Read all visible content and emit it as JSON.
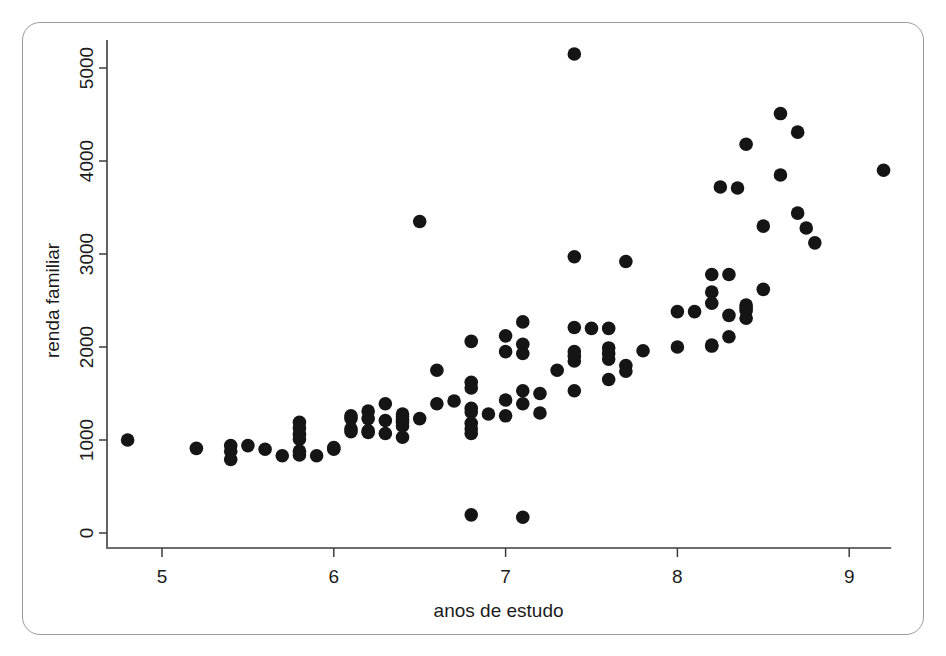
{
  "figure": {
    "frame_visible": true,
    "background_color": "#ffffff",
    "point_color": "#151515",
    "axis_color": "#3c3c3c"
  },
  "chart_data": {
    "type": "scatter",
    "title": "",
    "xlabel": "anos de estudo",
    "ylabel": "renda familiar",
    "xlim": [
      4.6,
      9.4
    ],
    "ylim": [
      -200,
      5400
    ],
    "xticks": [
      5,
      6,
      7,
      8,
      9
    ],
    "xtick_labels": [
      "5",
      "6",
      "7",
      "8",
      "9"
    ],
    "yticks": [
      0,
      1000,
      2000,
      3000,
      4000,
      5000
    ],
    "ytick_labels": [
      "0",
      "1000",
      "2000",
      "3000",
      "4000",
      "5000"
    ],
    "grid": false,
    "legend": false,
    "marker": "filled-circle",
    "marker_size": 9,
    "n_points": 108,
    "points": [
      [
        4.8,
        1000
      ],
      [
        5.2,
        910
      ],
      [
        5.4,
        940
      ],
      [
        5.4,
        880
      ],
      [
        5.4,
        790
      ],
      [
        5.5,
        940
      ],
      [
        5.6,
        900
      ],
      [
        5.7,
        830
      ],
      [
        5.8,
        1190
      ],
      [
        5.8,
        1130
      ],
      [
        5.8,
        1060
      ],
      [
        5.8,
        1010
      ],
      [
        5.8,
        880
      ],
      [
        5.8,
        840
      ],
      [
        5.9,
        830
      ],
      [
        6.0,
        900
      ],
      [
        6.0,
        920
      ],
      [
        6.1,
        1260
      ],
      [
        6.1,
        1230
      ],
      [
        6.1,
        1120
      ],
      [
        6.1,
        1090
      ],
      [
        6.2,
        1310
      ],
      [
        6.2,
        1230
      ],
      [
        6.2,
        1100
      ],
      [
        6.2,
        1080
      ],
      [
        6.3,
        1390
      ],
      [
        6.3,
        1210
      ],
      [
        6.3,
        1070
      ],
      [
        6.4,
        1280
      ],
      [
        6.4,
        1250
      ],
      [
        6.4,
        1220
      ],
      [
        6.4,
        1190
      ],
      [
        6.4,
        1150
      ],
      [
        6.4,
        1030
      ],
      [
        6.5,
        1230
      ],
      [
        6.5,
        3350
      ],
      [
        6.6,
        1390
      ],
      [
        6.6,
        1750
      ],
      [
        6.7,
        1420
      ],
      [
        6.8,
        2060
      ],
      [
        6.8,
        1620
      ],
      [
        6.8,
        1560
      ],
      [
        6.8,
        1340
      ],
      [
        6.8,
        1300
      ],
      [
        6.8,
        1180
      ],
      [
        6.8,
        1120
      ],
      [
        6.8,
        1070
      ],
      [
        6.8,
        195
      ],
      [
        6.9,
        1280
      ],
      [
        7.0,
        2120
      ],
      [
        7.0,
        1950
      ],
      [
        7.0,
        1430
      ],
      [
        7.0,
        1260
      ],
      [
        7.1,
        2270
      ],
      [
        7.1,
        2030
      ],
      [
        7.1,
        1930
      ],
      [
        7.1,
        1530
      ],
      [
        7.1,
        1390
      ],
      [
        7.1,
        170
      ],
      [
        7.2,
        1500
      ],
      [
        7.2,
        1290
      ],
      [
        7.3,
        1750
      ],
      [
        7.4,
        5150
      ],
      [
        7.4,
        2970
      ],
      [
        7.4,
        2210
      ],
      [
        7.4,
        1950
      ],
      [
        7.4,
        1900
      ],
      [
        7.4,
        1850
      ],
      [
        7.4,
        1530
      ],
      [
        7.5,
        2200
      ],
      [
        7.6,
        2200
      ],
      [
        7.6,
        1990
      ],
      [
        7.6,
        1930
      ],
      [
        7.6,
        1870
      ],
      [
        7.6,
        1650
      ],
      [
        7.7,
        2920
      ],
      [
        7.7,
        1800
      ],
      [
        7.7,
        1740
      ],
      [
        7.8,
        1960
      ],
      [
        8.0,
        2000
      ],
      [
        8.0,
        2380
      ],
      [
        8.1,
        2380
      ],
      [
        8.2,
        2780
      ],
      [
        8.2,
        2590
      ],
      [
        8.2,
        2470
      ],
      [
        8.2,
        2020
      ],
      [
        8.2,
        2010
      ],
      [
        8.25,
        3720
      ],
      [
        8.3,
        2780
      ],
      [
        8.3,
        2340
      ],
      [
        8.3,
        2110
      ],
      [
        8.35,
        3710
      ],
      [
        8.4,
        4180
      ],
      [
        8.4,
        2450
      ],
      [
        8.4,
        2420
      ],
      [
        8.4,
        2390
      ],
      [
        8.4,
        2310
      ],
      [
        8.5,
        3300
      ],
      [
        8.5,
        2620
      ],
      [
        8.6,
        4510
      ],
      [
        8.6,
        3850
      ],
      [
        8.7,
        4310
      ],
      [
        8.7,
        3440
      ],
      [
        8.75,
        3280
      ],
      [
        8.8,
        3120
      ],
      [
        9.2,
        3900
      ]
    ]
  },
  "axis": {
    "x_title": "anos de estudo",
    "y_title": "renda familiar"
  }
}
